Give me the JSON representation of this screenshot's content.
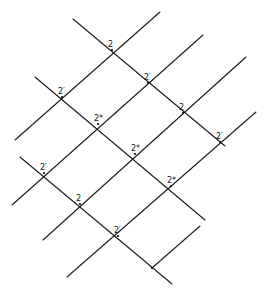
{
  "diagram": {
    "type": "lattice of intersecting parallel lines",
    "descending_lines": [
      {
        "x1": 73,
        "y1": 19,
        "x2": 225,
        "y2": 146
      },
      {
        "x1": 35,
        "y1": 77,
        "x2": 205,
        "y2": 220
      },
      {
        "x1": 20,
        "y1": 157,
        "x2": 172,
        "y2": 284
      }
    ],
    "ascending_lines": [
      {
        "x1": 15,
        "y1": 140,
        "x2": 160,
        "y2": 12
      },
      {
        "x1": 12,
        "y1": 205,
        "x2": 203,
        "y2": 35
      },
      {
        "x1": 43,
        "y1": 240,
        "x2": 246,
        "y2": 57
      },
      {
        "x1": 67,
        "y1": 277,
        "x2": 256,
        "y2": 112
      },
      {
        "x1": 152,
        "y1": 268,
        "x2": 200,
        "y2": 226
      }
    ],
    "nodes": [
      {
        "x": 112,
        "y": 50,
        "label": "2"
      },
      {
        "x": 148,
        "y": 83,
        "label": "2′"
      },
      {
        "x": 183,
        "y": 113,
        "label": "2"
      },
      {
        "x": 220,
        "y": 142,
        "label": "2′"
      },
      {
        "x": 62,
        "y": 97,
        "label": "2′"
      },
      {
        "x": 98,
        "y": 124,
        "label": "2*"
      },
      {
        "x": 135,
        "y": 154,
        "label": "2*"
      },
      {
        "x": 171,
        "y": 186,
        "label": "2*"
      },
      {
        "x": 44,
        "y": 173,
        "label": "2′"
      },
      {
        "x": 80,
        "y": 204,
        "label": "2"
      },
      {
        "x": 118,
        "y": 236,
        "label": "2′"
      },
      {
        "x": 152,
        "y": 268,
        "label": ""
      }
    ],
    "line_color": "#1a1a1a",
    "background": "#ffffff"
  }
}
